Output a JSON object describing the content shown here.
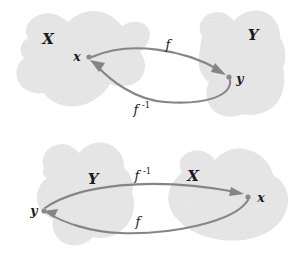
{
  "figure": {
    "background_color": "#ffffff",
    "blob_fill_color": "#e9e9e9",
    "arrow_color": "#858585",
    "label_color": "#1a1a1a",
    "point_color": "#8a8a8a"
  },
  "panels": [
    {
      "id": "top",
      "name": "forward-mapping-panel",
      "left_set_label": "X",
      "right_set_label": "Y",
      "source_point_label": "x",
      "target_point_label": "y",
      "forward_arrow_label": "f",
      "inverse_arrow_label": "f",
      "inverse_arrow_superscript": "-1",
      "forward_direction": "left-to-right",
      "inverse_direction": "right-to-left"
    },
    {
      "id": "bottom",
      "name": "inverse-mapping-panel",
      "left_set_label": "Y",
      "right_set_label": "X",
      "source_point_label": "y",
      "target_point_label": "x",
      "forward_arrow_label": "f",
      "inverse_arrow_label": "f",
      "inverse_arrow_superscript": "-1",
      "forward_direction": "right-to-left",
      "inverse_direction": "left-to-right"
    }
  ]
}
